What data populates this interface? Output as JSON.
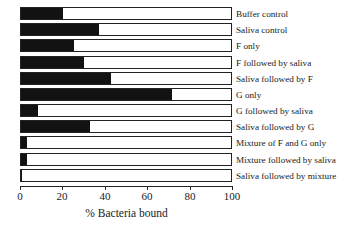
{
  "chart_data": {
    "type": "bar",
    "orientation": "horizontal",
    "title": "",
    "xlabel": "% Bacteria bound",
    "ylabel": "",
    "xlim": [
      0,
      100
    ],
    "xticks": [
      0,
      20,
      40,
      60,
      80,
      100
    ],
    "xtick_labels": [
      "0",
      "20",
      "40",
      "60",
      "80",
      "100"
    ],
    "grid": false,
    "legend": false,
    "categories": [
      "Buffer control",
      "Saliva control",
      "F only",
      "F followed by saliva",
      "Saliva followed by F",
      "G only",
      "G followed by saliva",
      "Saliva followed by G",
      "Mixture of F and G  only",
      "Mixture followed by saliva",
      "Saliva followed by mixture"
    ],
    "values": [
      20,
      37,
      25,
      30,
      43,
      72,
      8,
      33,
      3,
      3,
      0.5
    ],
    "series": [
      {
        "name": "% Bacteria bound",
        "values": [
          20,
          37,
          25,
          30,
          43,
          72,
          8,
          33,
          3,
          3,
          0.5
        ]
      }
    ],
    "colors": {
      "bar_fill": "#121212",
      "bar_outline": "#222222",
      "background": "#ffffff",
      "text": "#1a1a1a"
    }
  }
}
